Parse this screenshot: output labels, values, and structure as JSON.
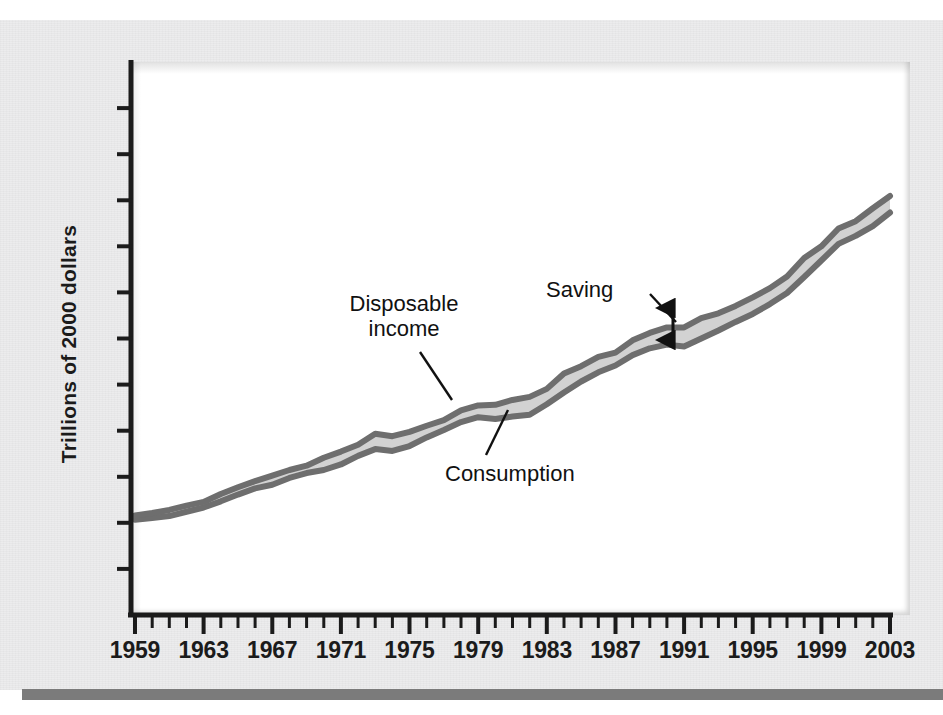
{
  "figure": {
    "background_color": "#ececed",
    "panel_color": "#ffffff",
    "rule_color": "#7b7b7b"
  },
  "axes": {
    "ylabel": "Trillions of 2000 dollars",
    "xtick_labels": [
      "1959",
      "1963",
      "1967",
      "1971",
      "1975",
      "1979",
      "1983",
      "1987",
      "1991",
      "1995",
      "1999",
      "2003"
    ],
    "ytick_count": 11,
    "ytick_labels": []
  },
  "annotations": {
    "disposable_income": "Disposable\nincome",
    "consumption": "Consumption",
    "saving": "Saving"
  },
  "colors": {
    "line_stroke": "#6e6e6e",
    "band_fill": "#d2d2d2",
    "axis": "#1b1b1b",
    "text": "#111111"
  },
  "chart_data": {
    "type": "area",
    "title": "",
    "xlabel": "",
    "ylabel": "Trillions of 2000 dollars",
    "xlim": [
      1959,
      2003
    ],
    "ylim": [
      0,
      9
    ],
    "grid": false,
    "legend": "none",
    "x": [
      1959,
      1960,
      1961,
      1962,
      1963,
      1964,
      1965,
      1966,
      1967,
      1968,
      1969,
      1970,
      1971,
      1972,
      1973,
      1974,
      1975,
      1976,
      1977,
      1978,
      1979,
      1980,
      1981,
      1982,
      1983,
      1984,
      1985,
      1986,
      1987,
      1988,
      1989,
      1990,
      1991,
      1992,
      1993,
      1994,
      1995,
      1996,
      1997,
      1998,
      1999,
      2000,
      2001,
      2002,
      2003
    ],
    "series": [
      {
        "name": "Disposable income",
        "values": [
          1.62,
          1.66,
          1.71,
          1.78,
          1.84,
          1.97,
          2.08,
          2.18,
          2.27,
          2.36,
          2.43,
          2.56,
          2.66,
          2.77,
          2.95,
          2.91,
          2.98,
          3.08,
          3.17,
          3.33,
          3.41,
          3.42,
          3.5,
          3.55,
          3.68,
          3.93,
          4.05,
          4.2,
          4.27,
          4.47,
          4.59,
          4.68,
          4.68,
          4.83,
          4.91,
          5.03,
          5.17,
          5.32,
          5.51,
          5.81,
          6.0,
          6.29,
          6.41,
          6.62,
          6.82
        ]
      },
      {
        "name": "Consumption",
        "values": [
          1.55,
          1.58,
          1.61,
          1.68,
          1.75,
          1.85,
          1.96,
          2.06,
          2.12,
          2.23,
          2.31,
          2.36,
          2.45,
          2.59,
          2.7,
          2.67,
          2.75,
          2.89,
          3.01,
          3.14,
          3.22,
          3.19,
          3.23,
          3.26,
          3.43,
          3.62,
          3.8,
          3.95,
          4.06,
          4.23,
          4.34,
          4.4,
          4.37,
          4.5,
          4.63,
          4.77,
          4.9,
          5.06,
          5.24,
          5.5,
          5.77,
          6.04,
          6.17,
          6.33,
          6.55
        ]
      }
    ],
    "derived_series": {
      "name": "Saving",
      "description": "Vertical gap between Disposable income and Consumption",
      "values": [
        0.07,
        0.08,
        0.1,
        0.1,
        0.09,
        0.12,
        0.12,
        0.12,
        0.15,
        0.13,
        0.12,
        0.2,
        0.21,
        0.18,
        0.25,
        0.24,
        0.23,
        0.19,
        0.16,
        0.19,
        0.19,
        0.23,
        0.27,
        0.29,
        0.25,
        0.31,
        0.25,
        0.25,
        0.21,
        0.24,
        0.25,
        0.28,
        0.31,
        0.33,
        0.28,
        0.26,
        0.27,
        0.26,
        0.27,
        0.31,
        0.23,
        0.25,
        0.24,
        0.29,
        0.27
      ]
    }
  }
}
